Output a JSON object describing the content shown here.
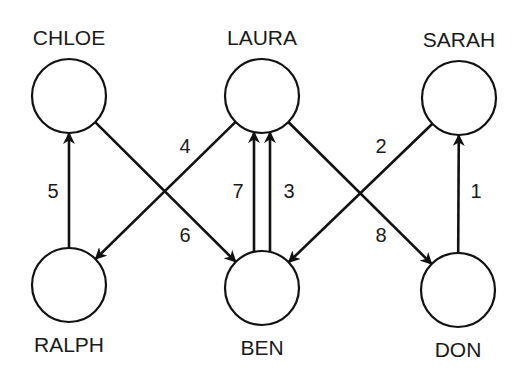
{
  "diagram": {
    "type": "directed-graph",
    "colors": {
      "stroke": "#111111",
      "background": "#ffffff",
      "text": "#1a1a1a"
    },
    "nodes": [
      {
        "id": "chloe",
        "label": "CHLOE",
        "x": 69,
        "y": 96,
        "r": 37,
        "label_pos": "above"
      },
      {
        "id": "laura",
        "label": "LAURA",
        "x": 262,
        "y": 96,
        "r": 37,
        "label_pos": "above"
      },
      {
        "id": "sarah",
        "label": "SARAH",
        "x": 459,
        "y": 98,
        "r": 37,
        "label_pos": "above"
      },
      {
        "id": "ralph",
        "label": "RALPH",
        "x": 69,
        "y": 285,
        "r": 37,
        "label_pos": "below"
      },
      {
        "id": "ben",
        "label": "BEN",
        "x": 262,
        "y": 288,
        "r": 37,
        "label_pos": "below"
      },
      {
        "id": "don",
        "label": "DON",
        "x": 458,
        "y": 290,
        "r": 37,
        "label_pos": "below"
      }
    ],
    "edges": [
      {
        "label": "1",
        "from": "don",
        "to": "sarah",
        "lx": 476,
        "ly": 198
      },
      {
        "label": "2",
        "from": "sarah",
        "to": "ben",
        "lx": 381,
        "ly": 153
      },
      {
        "label": "3",
        "from": "ben",
        "to": "laura",
        "lx": 289,
        "ly": 198,
        "offset": 8
      },
      {
        "label": "4",
        "from": "laura",
        "to": "ralph",
        "lx": 185,
        "ly": 153
      },
      {
        "label": "5",
        "from": "ralph",
        "to": "chloe",
        "lx": 53,
        "ly": 198
      },
      {
        "label": "6",
        "from": "chloe",
        "to": "ben",
        "lx": 185,
        "ly": 242
      },
      {
        "label": "7",
        "from": "ben",
        "to": "laura",
        "lx": 238,
        "ly": 198,
        "offset": -8
      },
      {
        "label": "8",
        "from": "laura",
        "to": "don",
        "lx": 381,
        "ly": 242
      }
    ]
  }
}
